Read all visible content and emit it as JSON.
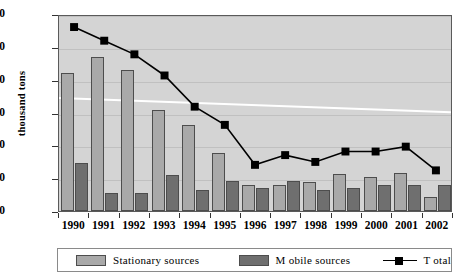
{
  "chart_data": {
    "type": "bar",
    "title": "",
    "xlabel": "",
    "ylabel": "thousand tons",
    "ylim": [
      0,
      3000
    ],
    "ytick_step": 500,
    "ytick_labels": [
      "3000",
      "2500",
      "2000",
      "1500",
      "1000",
      "500",
      "0"
    ],
    "grid": true,
    "legend_position": "bottom",
    "categories": [
      "1990",
      "1991",
      "1992",
      "1993",
      "1994",
      "1995",
      "1996",
      "1997",
      "1998",
      "1999",
      "2000",
      "2001",
      "2002"
    ],
    "series": [
      {
        "name": "Stationary sources",
        "kind": "bar",
        "color": "#a9a9a9",
        "values": [
          2100,
          2345,
          2155,
          1540,
          1305,
          885,
          390,
          390,
          445,
          565,
          515,
          585,
          220
        ]
      },
      {
        "name": "M obile sources",
        "kind": "bar",
        "color": "#6f6f6f",
        "values": [
          735,
          280,
          270,
          545,
          315,
          450,
          345,
          460,
          320,
          350,
          400,
          400,
          400
        ]
      },
      {
        "name": "Total",
        "kind": "line",
        "color": "#000000",
        "marker": "square",
        "values": [
          2830,
          2620,
          2410,
          2085,
          1605,
          1325,
          710,
          860,
          755,
          915,
          915,
          990,
          625
        ]
      }
    ],
    "trendline": {
      "name": "linear-trend",
      "color": "#ffffff",
      "start_value": 1740,
      "end_value": 1520
    }
  },
  "axis": {
    "y_title": "thousand tons"
  },
  "legend": {
    "items": [
      {
        "label": "Stationary sources",
        "icon": "bar-swatch-light"
      },
      {
        "label": "M obile sources",
        "icon": "bar-swatch-dark"
      },
      {
        "label": "T otal",
        "icon": "line-marker-swatch"
      }
    ]
  }
}
